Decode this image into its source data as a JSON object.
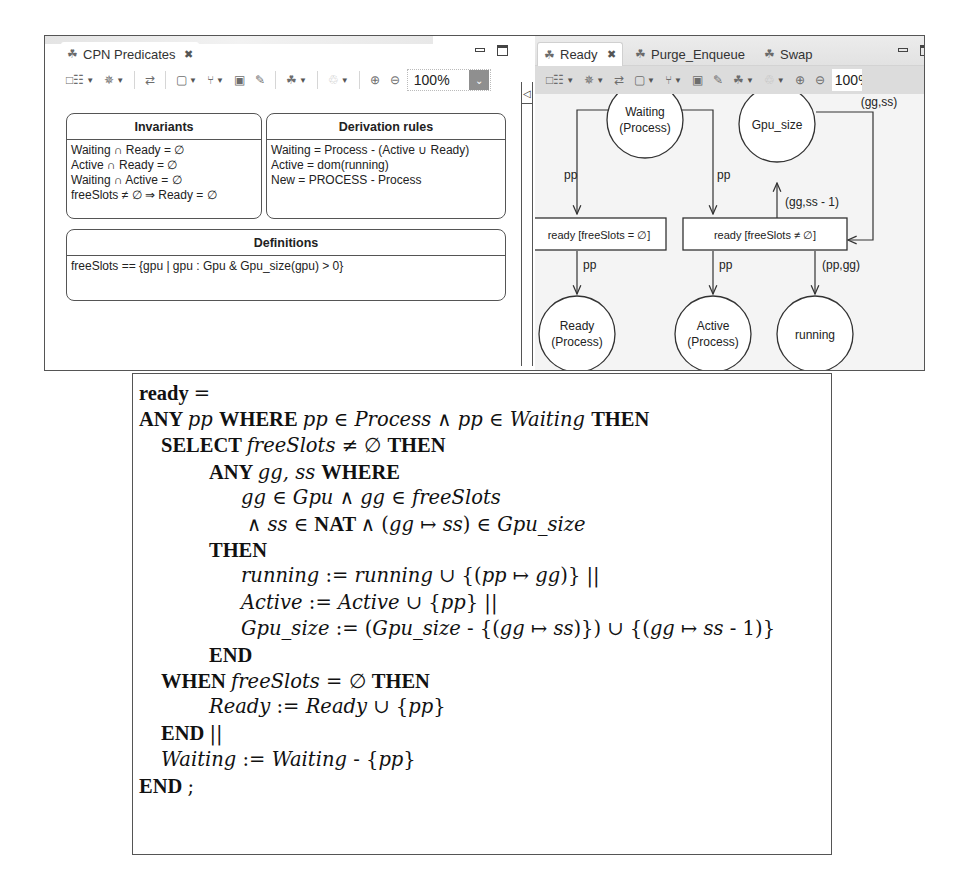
{
  "left_view": {
    "tab": {
      "icon": "diagram-icon",
      "label": "CPN Predicates",
      "close": "✕"
    },
    "toolbar": {
      "zoom_value": "100%"
    },
    "invariants": {
      "title": "Invariants",
      "lines": [
        "Waiting ∩ Ready = ∅",
        "Active ∩ Ready  = ∅",
        "Waiting ∩ Active = ∅",
        "freeSlots ≠ ∅ ⇒ Ready = ∅"
      ]
    },
    "derivation_rules": {
      "title": "Derivation rules",
      "lines": [
        "Waiting = Process - (Active ∪ Ready)",
        "Active = dom(running)",
        "New = PROCESS - Process"
      ]
    },
    "definitions": {
      "title": "Definitions",
      "lines": [
        "freeSlots == {gpu | gpu : Gpu & Gpu_size(gpu) > 0}"
      ]
    }
  },
  "right_view": {
    "tabs": [
      {
        "label": "Ready",
        "active": true,
        "close": "✕"
      },
      {
        "label": "Purge_Enqueue",
        "active": false
      },
      {
        "label": "Swap",
        "active": false
      }
    ],
    "toolbar": {
      "zoom_value": "100%"
    },
    "net": {
      "places": {
        "waiting": {
          "line1": "Waiting",
          "line2": "(Process)"
        },
        "gpu_size": {
          "line1": "Gpu_size"
        },
        "ready": {
          "line1": "Ready",
          "line2": "(Process)"
        },
        "active": {
          "line1": "Active",
          "line2": "(Process)"
        },
        "running": {
          "line1": "running"
        }
      },
      "transitions": {
        "t_empty": "ready [freeSlots = ∅]",
        "t_nonempty": "ready [freeSlots ≠ ∅]"
      },
      "arc_labels": {
        "waiting_to_t_empty": "pp",
        "waiting_to_t_nonempty": "pp",
        "gpu_guard": "[gg : freeSlots]",
        "gpu_to_t_nonempty": "(gg,ss)",
        "t_nonempty_to_gpu": "(gg,ss - 1)",
        "t_empty_to_ready": "pp",
        "t_nonempty_to_active": "pp",
        "t_nonempty_to_running": "(pp,gg)"
      }
    }
  },
  "formal_text": {
    "lines": [
      [
        {
          "t": "ready ",
          "s": "kw"
        },
        {
          "t": "=",
          "s": "op"
        }
      ],
      [
        {
          "t": "ANY ",
          "s": "kw"
        },
        {
          "t": "pp ",
          "s": "it"
        },
        {
          "t": "WHERE ",
          "s": "kw"
        },
        {
          "t": "pp ",
          "s": "it"
        },
        {
          "t": "∈ ",
          "s": "op"
        },
        {
          "t": "Process ",
          "s": "it"
        },
        {
          "t": "∧ ",
          "s": "op"
        },
        {
          "t": "pp ",
          "s": "it"
        },
        {
          "t": "∈ ",
          "s": "op"
        },
        {
          "t": "Waiting ",
          "s": "it"
        },
        {
          "t": "THEN",
          "s": "kw"
        }
      ],
      [
        {
          "t": "SELECT ",
          "s": "kw"
        },
        {
          "t": "freeSlots ",
          "s": "it"
        },
        {
          "t": "≠ ∅ ",
          "s": "op"
        },
        {
          "t": "THEN",
          "s": "kw"
        }
      ],
      [
        {
          "t": "ANY ",
          "s": "kw"
        },
        {
          "t": "gg, ss ",
          "s": "it"
        },
        {
          "t": "WHERE",
          "s": "kw"
        }
      ],
      [
        {
          "t": "gg ",
          "s": "it"
        },
        {
          "t": "∈ ",
          "s": "op"
        },
        {
          "t": "Gpu ",
          "s": "it"
        },
        {
          "t": "∧ ",
          "s": "op"
        },
        {
          "t": "gg ",
          "s": "it"
        },
        {
          "t": "∈ ",
          "s": "op"
        },
        {
          "t": "freeSlots",
          "s": "it"
        }
      ],
      [
        {
          "t": "∧ ",
          "s": "op"
        },
        {
          "t": "ss ",
          "s": "it"
        },
        {
          "t": "∈ ",
          "s": "op"
        },
        {
          "t": "NAT ",
          "s": "kw"
        },
        {
          "t": "∧ (",
          "s": "op"
        },
        {
          "t": "gg ",
          "s": "it"
        },
        {
          "t": "↦ ",
          "s": "op"
        },
        {
          "t": "ss",
          "s": "it"
        },
        {
          "t": ") ∈ ",
          "s": "op"
        },
        {
          "t": "Gpu_size",
          "s": "it"
        }
      ],
      [
        {
          "t": "THEN",
          "s": "kw"
        }
      ],
      [
        {
          "t": "running ",
          "s": "it"
        },
        {
          "t": ":= ",
          "s": "op"
        },
        {
          "t": "running ",
          "s": "it"
        },
        {
          "t": "∪ {(",
          "s": "op"
        },
        {
          "t": "pp ",
          "s": "it"
        },
        {
          "t": "↦ ",
          "s": "op"
        },
        {
          "t": "gg",
          "s": "it"
        },
        {
          "t": ")} ||",
          "s": "op"
        }
      ],
      [
        {
          "t": "Active ",
          "s": "it"
        },
        {
          "t": ":= ",
          "s": "op"
        },
        {
          "t": "Active ",
          "s": "it"
        },
        {
          "t": "∪ {",
          "s": "op"
        },
        {
          "t": "pp",
          "s": "it"
        },
        {
          "t": "} ||",
          "s": "op"
        }
      ],
      [
        {
          "t": "Gpu_size ",
          "s": "it"
        },
        {
          "t": ":= (",
          "s": "op"
        },
        {
          "t": "Gpu_size ",
          "s": "it"
        },
        {
          "t": "- {(",
          "s": "op"
        },
        {
          "t": "gg ",
          "s": "it"
        },
        {
          "t": "↦ ",
          "s": "op"
        },
        {
          "t": "ss",
          "s": "it"
        },
        {
          "t": ")}) ∪ {(",
          "s": "op"
        },
        {
          "t": "gg ",
          "s": "it"
        },
        {
          "t": "↦ ",
          "s": "op"
        },
        {
          "t": "ss ",
          "s": "it"
        },
        {
          "t": "- 1)}",
          "s": "op"
        }
      ],
      [
        {
          "t": "END",
          "s": "kw"
        }
      ],
      [
        {
          "t": "WHEN ",
          "s": "kw"
        },
        {
          "t": "freeSlots ",
          "s": "it"
        },
        {
          "t": "= ∅ ",
          "s": "op"
        },
        {
          "t": "THEN",
          "s": "kw"
        }
      ],
      [
        {
          "t": "Ready ",
          "s": "it"
        },
        {
          "t": ":= ",
          "s": "op"
        },
        {
          "t": "Ready ",
          "s": "it"
        },
        {
          "t": "∪ {",
          "s": "op"
        },
        {
          "t": "pp",
          "s": "it"
        },
        {
          "t": "}",
          "s": "op"
        }
      ],
      [
        {
          "t": "END ",
          "s": "kw"
        },
        {
          "t": "||",
          "s": "op"
        }
      ],
      [
        {
          "t": "Waiting ",
          "s": "it"
        },
        {
          "t": ":= ",
          "s": "op"
        },
        {
          "t": "Waiting ",
          "s": "it"
        },
        {
          "t": "- {",
          "s": "op"
        },
        {
          "t": "pp",
          "s": "it"
        },
        {
          "t": "}",
          "s": "op"
        }
      ],
      [
        {
          "t": "END ",
          "s": "kw"
        },
        {
          "t": ";",
          "s": "op"
        }
      ]
    ],
    "indents": [
      0,
      0,
      1,
      2,
      3,
      3.2,
      2,
      3,
      3,
      3,
      2,
      1,
      2,
      1,
      1,
      0
    ]
  }
}
